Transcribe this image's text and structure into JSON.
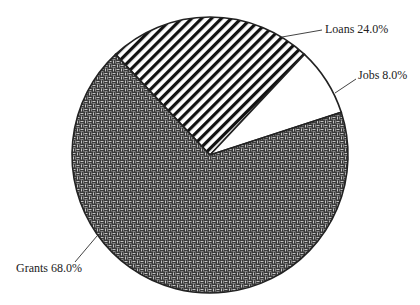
{
  "chart_data": {
    "type": "pie",
    "title": "",
    "categories": [
      "Grants",
      "Loans",
      "Jobs"
    ],
    "values": [
      68.0,
      24.0,
      8.0
    ],
    "labels": [
      "Grants 68.0%",
      "Loans 24.0%",
      "Jobs 8.0%"
    ],
    "start_angle_deg_clockwise_from_top": -43.2,
    "order_clockwise": [
      "Loans",
      "Jobs",
      "Grants"
    ],
    "fills": {
      "Grants": "basketweave-pattern-dark",
      "Loans": "diagonal-stripes",
      "Jobs": "white"
    },
    "legend": "none (leader-line labels)"
  },
  "labels": {
    "grants": "Grants 68.0%",
    "loans": "Loans 24.0%",
    "jobs": "Jobs 8.0%"
  },
  "colors": {
    "outline": "#222222",
    "stripe": "#111111",
    "weave_dark": "#3a3a3a",
    "weave_light": "#bdbdbd",
    "background": "#ffffff"
  }
}
